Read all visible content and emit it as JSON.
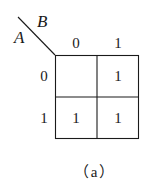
{
  "kmap": {
    "row_variable": "A",
    "col_variable": "B",
    "col_headers": [
      "0",
      "1"
    ],
    "row_headers": [
      "0",
      "1"
    ],
    "cells": [
      [
        "",
        "1"
      ],
      [
        "1",
        "1"
      ]
    ],
    "caption": "（a）",
    "line_color": "#1a1a1a"
  }
}
